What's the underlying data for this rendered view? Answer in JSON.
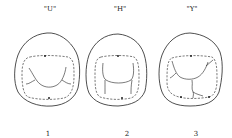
{
  "figure": {
    "ink_color": "#222222",
    "background": "#ffffff",
    "panels": [
      {
        "pattern_label": "\"U\"",
        "number": "1",
        "pattern": "U"
      },
      {
        "pattern_label": "\"H\"",
        "number": "2",
        "pattern": "H"
      },
      {
        "pattern_label": "\"Y\"",
        "number": "3",
        "pattern": "Y"
      }
    ]
  }
}
